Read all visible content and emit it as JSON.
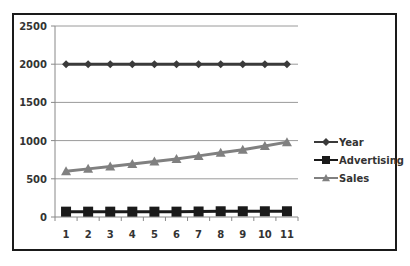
{
  "chart_data": {
    "type": "line",
    "title": "",
    "xlabel": "",
    "ylabel": "",
    "categories": [
      "1",
      "2",
      "3",
      "4",
      "5",
      "6",
      "7",
      "8",
      "9",
      "10",
      "11"
    ],
    "series": [
      {
        "name": "Year",
        "values": [
          2000,
          2000,
          2000,
          2000,
          2000,
          2000,
          2000,
          2000,
          2000,
          2000,
          2000
        ],
        "color": "#3a3a3a",
        "marker": "diamond"
      },
      {
        "name": "Advertising",
        "values": [
          70,
          70,
          70,
          70,
          70,
          70,
          72,
          75,
          75,
          75,
          75
        ],
        "color": "#1a1a1a",
        "marker": "square"
      },
      {
        "name": "Sales",
        "values": [
          600,
          630,
          660,
          695,
          725,
          760,
          800,
          840,
          880,
          930,
          980
        ],
        "color": "#808080",
        "marker": "triangle"
      }
    ],
    "yticks": [
      0,
      500,
      1000,
      1500,
      2000,
      2500
    ],
    "ylim": [
      0,
      2500
    ],
    "grid": true,
    "legend_position": "right"
  }
}
